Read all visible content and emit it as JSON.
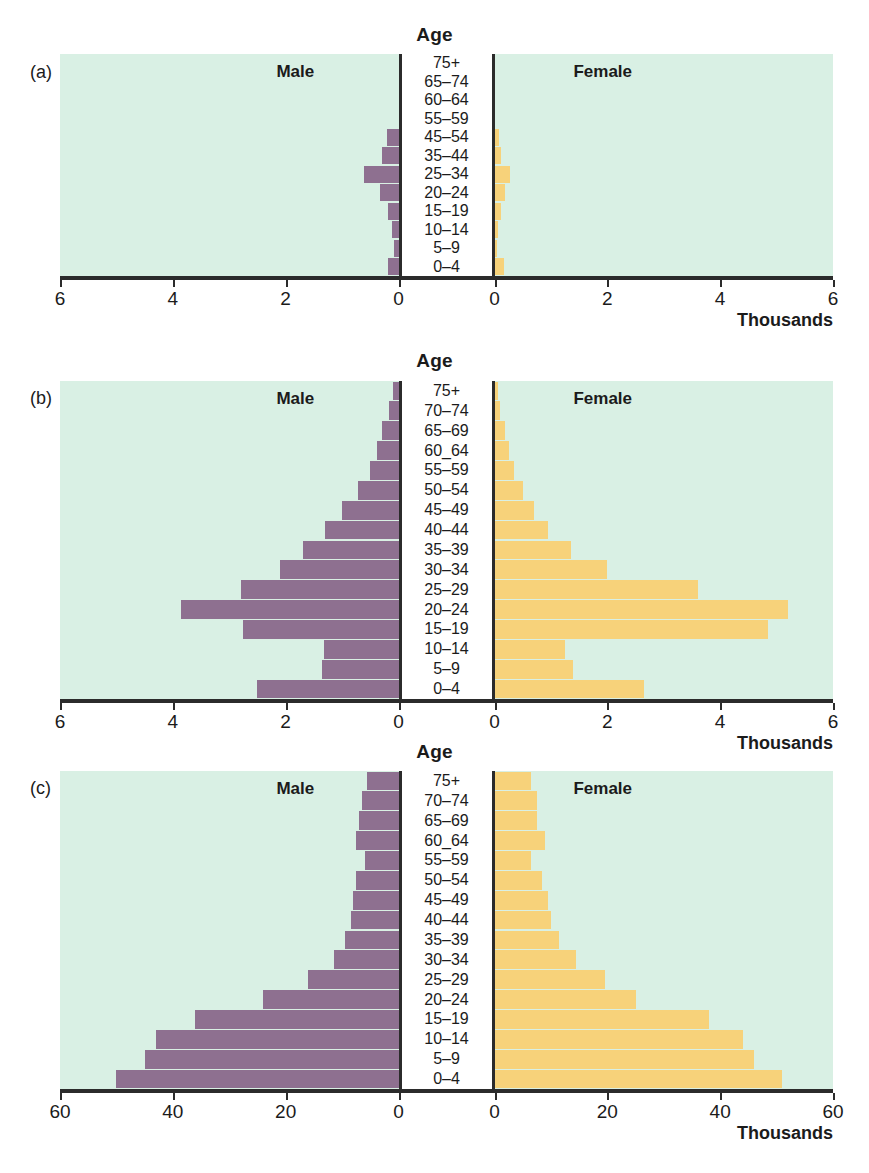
{
  "figure": {
    "background": "#ffffff",
    "plot_background": "#d9f0e4",
    "male_color": "#8e7090",
    "female_color": "#f7d27a",
    "axis_color": "#2b2b2b",
    "age_caption": "Age",
    "male_label": "Male",
    "female_label": "Female",
    "units_label": "Thousands"
  },
  "panels": [
    {
      "letter": "(a)",
      "xmax": 6,
      "ticks": [
        0,
        2,
        4,
        6
      ],
      "tick_labels_left": [
        "6",
        "4",
        "2",
        "0"
      ],
      "tick_labels_right": [
        "0",
        "2",
        "4",
        "6"
      ]
    },
    {
      "letter": "(b)",
      "xmax": 6,
      "ticks": [
        0,
        2,
        4,
        6
      ],
      "tick_labels_left": [
        "6",
        "4",
        "2",
        "0"
      ],
      "tick_labels_right": [
        "0",
        "2",
        "4",
        "6"
      ]
    },
    {
      "letter": "(c)",
      "xmax": 60,
      "ticks": [
        0,
        20,
        40,
        60
      ],
      "tick_labels_left": [
        "60",
        "40",
        "20",
        "0"
      ],
      "tick_labels_right": [
        "0",
        "20",
        "40",
        "60"
      ]
    }
  ],
  "chart_data": [
    {
      "type": "bar",
      "subtype": "population-pyramid",
      "panel": "(a)",
      "title": "Age",
      "xlabel": "Thousands",
      "ylabel": "Age",
      "xlim": [
        0,
        6
      ],
      "xticks": [
        0,
        2,
        4,
        6
      ],
      "grid": false,
      "legend": [
        "Male",
        "Female"
      ],
      "legend_position": "inside-top-left-and-right",
      "categories": [
        "0–4",
        "5–9",
        "10–14",
        "15–19",
        "20–24",
        "25–34",
        "35–44",
        "45–54",
        "55–59",
        "60–64",
        "65–74",
        "75+"
      ],
      "series": [
        {
          "name": "Male",
          "values": [
            0.18,
            0.08,
            0.12,
            0.18,
            0.32,
            0.62,
            0.3,
            0.2,
            0.0,
            0.0,
            0.0,
            0.0
          ]
        },
        {
          "name": "Female",
          "values": [
            0.16,
            0.05,
            0.07,
            0.11,
            0.18,
            0.28,
            0.12,
            0.08,
            0.0,
            0.0,
            0.0,
            0.0
          ]
        }
      ]
    },
    {
      "type": "bar",
      "subtype": "population-pyramid",
      "panel": "(b)",
      "title": "Age",
      "xlabel": "Thousands",
      "ylabel": "Age",
      "xlim": [
        0,
        6
      ],
      "xticks": [
        0,
        2,
        4,
        6
      ],
      "grid": false,
      "legend": [
        "Male",
        "Female"
      ],
      "legend_position": "inside-top-left-and-right",
      "categories": [
        "0–4",
        "5–9",
        "10–14",
        "15–19",
        "20–24",
        "25–29",
        "30–34",
        "35–39",
        "40–44",
        "45–49",
        "50–54",
        "55–59",
        "60_64",
        "65–69",
        "70–74",
        "75+"
      ],
      "series": [
        {
          "name": "Male",
          "values": [
            2.5,
            1.35,
            1.32,
            2.75,
            3.85,
            2.8,
            2.1,
            1.7,
            1.3,
            1.0,
            0.72,
            0.5,
            0.38,
            0.3,
            0.16,
            0.1
          ]
        },
        {
          "name": "Female",
          "values": [
            2.65,
            1.4,
            1.25,
            4.85,
            5.2,
            3.6,
            2.0,
            1.35,
            0.95,
            0.7,
            0.5,
            0.35,
            0.26,
            0.18,
            0.1,
            0.06
          ]
        }
      ]
    },
    {
      "type": "bar",
      "subtype": "population-pyramid",
      "panel": "(c)",
      "title": "Age",
      "xlabel": "Thousands",
      "ylabel": "Age",
      "xlim": [
        0,
        60
      ],
      "xticks": [
        0,
        20,
        40,
        60
      ],
      "grid": false,
      "legend": [
        "Male",
        "Female"
      ],
      "legend_position": "inside-top-left-and-right",
      "categories": [
        "0–4",
        "5–9",
        "10–14",
        "15–19",
        "20–24",
        "25–29",
        "30–34",
        "35–39",
        "40–44",
        "45–49",
        "50–54",
        "55–59",
        "60_64",
        "65–69",
        "70–74",
        "75+"
      ],
      "series": [
        {
          "name": "Male",
          "values": [
            50.0,
            45.0,
            43.0,
            36.0,
            24.0,
            16.0,
            11.5,
            9.5,
            8.5,
            8.0,
            7.5,
            6.0,
            7.5,
            7.0,
            6.5,
            5.5
          ]
        },
        {
          "name": "Female",
          "values": [
            51.0,
            46.0,
            44.0,
            38.0,
            25.0,
            19.5,
            14.5,
            11.5,
            10.0,
            9.5,
            8.5,
            6.5,
            9.0,
            7.5,
            7.5,
            6.5
          ]
        }
      ]
    }
  ]
}
